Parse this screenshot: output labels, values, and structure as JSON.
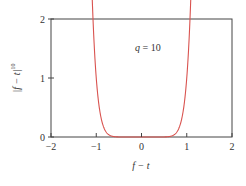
{
  "chart_data": {
    "type": "line",
    "title": "",
    "xlabel": "f − t",
    "ylabel": "|f − t|^10",
    "ylabel_base": "|f − t|",
    "ylabel_exp": "10",
    "xlim": [
      -2,
      2
    ],
    "ylim": [
      0,
      2
    ],
    "xticks": [
      -2,
      -1,
      0,
      1,
      2
    ],
    "xtick_labels": [
      "−2",
      "−1",
      "0",
      "1",
      "2"
    ],
    "yticks": [
      0,
      1,
      2
    ],
    "ytick_labels": [
      "0",
      "1",
      "2"
    ],
    "grid": false,
    "legend": null,
    "annotations": [
      {
        "text": "q = 10",
        "x": 0.1,
        "y": 1.5
      }
    ],
    "series": [
      {
        "name": "|f − t|^q, q = 10",
        "color": "#d9534f",
        "function": "|x|^10",
        "x": [
          -1.07,
          -1.05,
          -1.0,
          -0.95,
          -0.9,
          -0.85,
          -0.8,
          -0.7,
          -0.6,
          -0.5,
          0,
          0.5,
          0.6,
          0.7,
          0.8,
          0.85,
          0.9,
          0.95,
          1.0,
          1.05,
          1.07
        ],
        "values": [
          1.97,
          1.63,
          1.0,
          0.6,
          0.35,
          0.2,
          0.11,
          0.028,
          0.006,
          0.001,
          0,
          0.001,
          0.006,
          0.028,
          0.11,
          0.2,
          0.35,
          0.6,
          1.0,
          1.63,
          1.97
        ]
      }
    ]
  },
  "colors": {
    "curve": "#d9534f",
    "axis": "#444444",
    "text": "#333333"
  }
}
